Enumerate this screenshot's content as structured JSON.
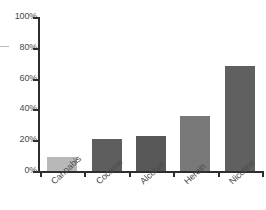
{
  "chart_data": {
    "type": "bar",
    "title": "",
    "subtitle": "",
    "xlabel": "",
    "ylabel": "",
    "categories": [
      "Cannabis",
      "Cocaine",
      "Alcohol",
      "Heroin",
      "Nicotine"
    ],
    "values": [
      9,
      21,
      23,
      36,
      68
    ],
    "value_suffix": "%",
    "ylim": [
      0,
      100
    ],
    "ytick_values": [
      0,
      20,
      40,
      60,
      80,
      100
    ],
    "ytick_labels": [
      "0%",
      "20%",
      "40%",
      "60%",
      "80%",
      "100%"
    ],
    "grid": false,
    "legend": "none",
    "bar_colors": [
      "#b8b8b8",
      "#5e5e5e",
      "#585858",
      "#787878",
      "#606060"
    ],
    "axis_color": "#2e2e2e",
    "tick_label_color": "#4a4a4a",
    "background_color": "#ffffff"
  }
}
